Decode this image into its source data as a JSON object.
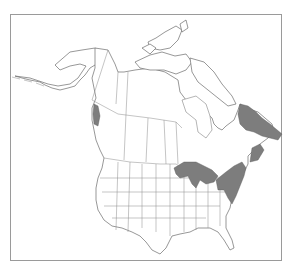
{
  "map": {
    "title": "",
    "region": "North America",
    "description": "Range map with shaded distribution areas",
    "colors": {
      "background": "#ffffff",
      "frame": "#9a9a9a",
      "outline": "#6b6b6b",
      "range_fill": "#7d7d7d"
    },
    "shaded_regions": [
      "Great Lakes region",
      "Southern Ontario / Quebec / New England",
      "Maritime provinces",
      "Labrador / Newfoundland",
      "Pacific northwest coast (Alaska panhandle / BC coast)"
    ]
  }
}
